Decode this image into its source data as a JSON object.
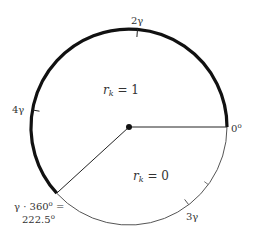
{
  "diagram": {
    "title": "",
    "circle": {
      "cx": 129,
      "cy": 127,
      "r": 98
    },
    "thick_arc": {
      "from_deg": 0,
      "to_deg": 222.5,
      "direction": "counterclockwise",
      "stroke_width": 3.2,
      "color": "#111111"
    },
    "thin_arc": {
      "from_deg": 222.5,
      "to_deg": 360,
      "direction": "counterclockwise",
      "stroke_width": 1,
      "color": "#555555"
    },
    "radii": [
      {
        "to_deg": 0
      },
      {
        "to_deg": 222.5
      }
    ],
    "center_dot": true,
    "regions": {
      "upper": {
        "label": "r",
        "sub": "k",
        "eq": " = 1"
      },
      "lower": {
        "label": "r",
        "sub": "k",
        "eq": " = 0"
      }
    },
    "labels": {
      "zero": "0",
      "zero_sup": "o",
      "two_gamma": "2γ",
      "three_gamma": "3γ",
      "four_gamma": "4γ",
      "gamma_line1": "γ · 360",
      "gamma_line1_sup": "o",
      "gamma_line1_eq": " =",
      "gamma_line2": "222.5",
      "gamma_line2_sup": "o"
    },
    "ticks": [
      {
        "deg": 85,
        "label": "2γ"
      },
      {
        "deg": 170,
        "label": "4γ"
      },
      {
        "deg": 307.5,
        "label": "3γ"
      },
      {
        "deg": 324,
        "label": ""
      }
    ]
  }
}
